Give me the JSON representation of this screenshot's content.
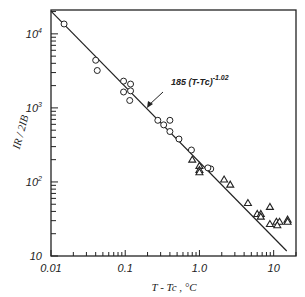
{
  "chart_data": {
    "type": "scatter",
    "title": "",
    "xlabel": "T - Tc , °C",
    "ylabel": "IR / 2IB",
    "xscale": "log",
    "yscale": "log",
    "xlim": [
      0.01,
      20
    ],
    "ylim": [
      10,
      21000
    ],
    "grid": false,
    "x_ticks": [
      {
        "value": 0.01,
        "label": "0.01"
      },
      {
        "value": 0.1,
        "label": "0.1"
      },
      {
        "value": 1.0,
        "label": "1.0"
      },
      {
        "value": 10,
        "label": "10"
      }
    ],
    "y_ticks": [
      {
        "value": 10,
        "label": "10",
        "exp": ""
      },
      {
        "value": 100,
        "label": "10",
        "exp": "2"
      },
      {
        "value": 1000,
        "label": "10",
        "exp": "3"
      },
      {
        "value": 10000,
        "label": "10",
        "exp": "4"
      }
    ],
    "series": [
      {
        "name": "circles",
        "marker": "circle",
        "points": [
          [
            0.015,
            13600
          ],
          [
            0.04,
            4400
          ],
          [
            0.042,
            3200
          ],
          [
            0.095,
            2300
          ],
          [
            0.118,
            2100
          ],
          [
            0.095,
            1640
          ],
          [
            0.118,
            1700
          ],
          [
            0.115,
            1260
          ],
          [
            0.275,
            680
          ],
          [
            0.33,
            590
          ],
          [
            0.4,
            680
          ],
          [
            0.4,
            480
          ],
          [
            0.53,
            380
          ],
          [
            0.78,
            270
          ],
          [
            1.42,
            150
          ],
          [
            1.3,
            155
          ]
        ]
      },
      {
        "name": "triangles",
        "marker": "triangle",
        "points": [
          [
            0.8,
            200
          ],
          [
            1.0,
            165
          ],
          [
            1.0,
            145
          ],
          [
            1.0,
            135
          ],
          [
            2.15,
            108
          ],
          [
            2.6,
            92
          ],
          [
            4.5,
            52
          ],
          [
            6.0,
            37
          ],
          [
            6.7,
            37
          ],
          [
            6.7,
            34
          ],
          [
            8.9,
            46
          ],
          [
            8.9,
            27
          ],
          [
            10.9,
            29
          ],
          [
            12.0,
            29
          ],
          [
            11.2,
            26
          ],
          [
            15.4,
            31
          ],
          [
            15.4,
            29
          ]
        ]
      }
    ],
    "fit_line": {
      "coefficient": 185,
      "exponent": -1.02,
      "x_range": [
        0.01,
        15
      ],
      "label_main": "185 (T-Tc)",
      "label_exp": "-1.02"
    }
  }
}
